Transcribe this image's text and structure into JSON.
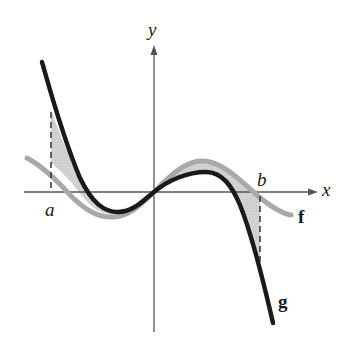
{
  "diagram": {
    "title": "",
    "axes": {
      "x_label": "x",
      "y_label": "y"
    },
    "points": {
      "a_label": "a",
      "b_label": "b"
    },
    "curves": [
      {
        "name": "f",
        "label": "f",
        "color": "#a9a9a9",
        "style": "gray thick"
      },
      {
        "name": "g",
        "label": "g",
        "color": "#1a1a1a",
        "style": "black thick"
      }
    ],
    "shading": {
      "color": "#c8c8c8",
      "between": [
        "f",
        "g"
      ],
      "from": "a",
      "to": "b"
    },
    "colors": {
      "axis": "#555555",
      "curve_f": "#a9a9a9",
      "curve_g": "#1a1a1a",
      "fill": "#cdcdcd",
      "dashed": "#333333"
    }
  }
}
